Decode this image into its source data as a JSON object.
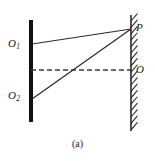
{
  "figure": {
    "caption": "(a)",
    "width": 155,
    "height": 161,
    "background_color": "#ffffff",
    "ink_color": "#1a1a1a"
  },
  "labels": {
    "source_upper": {
      "base": "O",
      "sub": "1"
    },
    "source_lower": {
      "base": "O",
      "sub": "2"
    },
    "point_p": "P",
    "point_o": "O"
  },
  "elements": {
    "barrier": {
      "name": "opaque-screen-bar",
      "x": 31,
      "y_top": 20,
      "y_bottom": 122,
      "thickness": 4,
      "color": "#111111"
    },
    "wall": {
      "name": "hatched-wall",
      "x": 131,
      "y_top": 15,
      "y_bottom": 131,
      "thickness": 1.6,
      "color": "#2b2b2b",
      "hatch_count": 18,
      "hatch_length": 9,
      "hatch_angle_deg": 55
    },
    "axis_dashed": {
      "name": "optical-axis-dashed-line",
      "x_start": 31,
      "x_end": 131,
      "y": 70,
      "dash": "5 3",
      "color": "#3a3a3a"
    },
    "ray_upper": {
      "name": "ray-O1-to-P",
      "x1": 32,
      "y1": 44,
      "x2": 131,
      "y2": 29,
      "color": "#2b2b2b"
    },
    "ray_lower": {
      "name": "ray-O2-to-P",
      "x1": 32,
      "y1": 99,
      "x2": 131,
      "y2": 29,
      "color": "#2b2b2b"
    }
  }
}
